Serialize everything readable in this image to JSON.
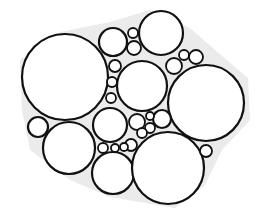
{
  "diagram": {
    "type": "circle-packing",
    "width": 259,
    "height": 224,
    "background": "#ffffff",
    "fill_background": "#e6e6e6",
    "circle_fill": "#ffffff",
    "stroke_color": "#111111",
    "stroke_width": 2.2,
    "hull": "20,60 60,32 110,22 150,10 190,28 215,50 248,78 250,120 222,150 205,185 175,208 110,197 70,180 30,150 22,110",
    "circles": [
      {
        "id": "large-left",
        "cx": 65,
        "cy": 77,
        "r": 43
      },
      {
        "id": "top-small-medium",
        "cx": 113,
        "cy": 42,
        "r": 14
      },
      {
        "id": "top-right-medium",
        "cx": 161,
        "cy": 33,
        "r": 22
      },
      {
        "id": "center",
        "cx": 142,
        "cy": 86,
        "r": 25
      },
      {
        "id": "right-large",
        "cx": 206,
        "cy": 103,
        "r": 38
      },
      {
        "id": "left-small",
        "cx": 38,
        "cy": 127,
        "r": 10
      },
      {
        "id": "left-bottom-medium",
        "cx": 69,
        "cy": 148,
        "r": 26
      },
      {
        "id": "center-small",
        "cx": 110,
        "cy": 125,
        "r": 17
      },
      {
        "id": "bottom-middle",
        "cx": 113,
        "cy": 173,
        "r": 21
      },
      {
        "id": "bottom-right-large",
        "cx": 168,
        "cy": 168,
        "r": 36
      },
      {
        "id": "tiny-1",
        "cx": 133,
        "cy": 33,
        "r": 5
      },
      {
        "id": "tiny-2",
        "cx": 134,
        "cy": 48,
        "r": 7
      },
      {
        "id": "tiny-3",
        "cx": 115,
        "cy": 66,
        "r": 6
      },
      {
        "id": "tiny-4",
        "cx": 112,
        "cy": 82,
        "r": 5
      },
      {
        "id": "tiny-5",
        "cx": 111,
        "cy": 98,
        "r": 5
      },
      {
        "id": "tiny-6",
        "cx": 174,
        "cy": 66,
        "r": 8
      },
      {
        "id": "tiny-7",
        "cx": 184,
        "cy": 55,
        "r": 5
      },
      {
        "id": "tiny-8",
        "cx": 196,
        "cy": 57,
        "r": 7
      },
      {
        "id": "tiny-9",
        "cx": 137,
        "cy": 122,
        "r": 8
      },
      {
        "id": "tiny-10",
        "cx": 162,
        "cy": 119,
        "r": 9
      },
      {
        "id": "tiny-11",
        "cx": 150,
        "cy": 116,
        "r": 4
      },
      {
        "id": "tiny-12",
        "cx": 150,
        "cy": 128,
        "r": 5
      },
      {
        "id": "tiny-13",
        "cx": 142,
        "cy": 133,
        "r": 5
      },
      {
        "id": "tiny-14",
        "cx": 131,
        "cy": 145,
        "r": 6
      },
      {
        "id": "tiny-15",
        "cx": 103,
        "cy": 148,
        "r": 5
      },
      {
        "id": "tiny-16",
        "cx": 115,
        "cy": 148,
        "r": 4
      },
      {
        "id": "tiny-17",
        "cx": 206,
        "cy": 151,
        "r": 6
      },
      {
        "id": "tiny-18",
        "cx": 124,
        "cy": 147,
        "r": 4
      }
    ]
  }
}
